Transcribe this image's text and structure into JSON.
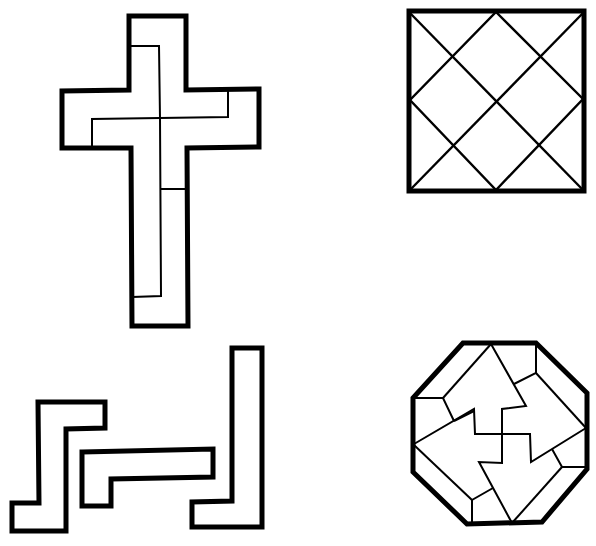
{
  "figure": {
    "panels": [
      {
        "id": "cross",
        "label": "Latin cross divided into pieces",
        "position": "top-left"
      },
      {
        "id": "square",
        "label": "Square divided by diagonal grid",
        "position": "top-right"
      },
      {
        "id": "polyominoes",
        "label": "Three separate polyomino pieces (Z, step, L shapes)",
        "position": "bottom-left"
      },
      {
        "id": "octagon",
        "label": "Octagon dissected into arrow-shaped pieces around a pinwheel",
        "position": "bottom-right"
      }
    ],
    "colors": {
      "stroke": "#000000",
      "background": "#ffffff"
    }
  }
}
